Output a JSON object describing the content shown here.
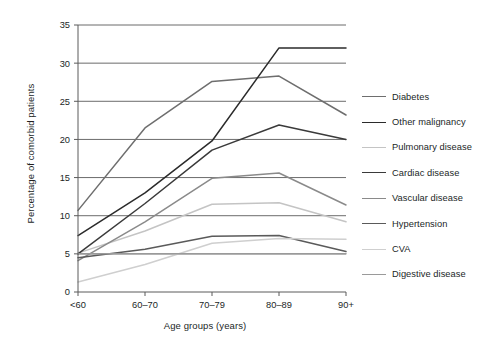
{
  "chart_data": {
    "type": "line",
    "title": "",
    "xlabel": "Age groups (years)",
    "ylabel": "Percentage of comorbid patients",
    "categories": [
      "<60",
      "60–70",
      "70–79",
      "80–89",
      "90+"
    ],
    "ylim": [
      0,
      35
    ],
    "yticks": [
      0,
      5,
      10,
      15,
      20,
      25,
      30,
      35
    ],
    "ytick_labels": [
      "0",
      "5",
      "10",
      "15",
      "20",
      "25",
      "30",
      "35"
    ],
    "grid": "horizontal",
    "legend_position": "right",
    "series": [
      {
        "name": "Diabetes",
        "color": "#6e6e6e",
        "values": [
          10.7,
          21.5,
          27.6,
          28.3,
          23.2
        ]
      },
      {
        "name": "Other malignancy",
        "color": "#2b2b2b",
        "values": [
          7.4,
          13.0,
          19.8,
          32.0,
          32.0
        ]
      },
      {
        "name": "Pulmonary disease",
        "color": "#c4c4c4",
        "values": [
          5.1,
          8.0,
          11.5,
          11.7,
          9.2
        ]
      },
      {
        "name": "Cardiac disease",
        "color": "#3a3a3a",
        "values": [
          5.0,
          11.6,
          18.6,
          21.9,
          20.0
        ]
      },
      {
        "name": "Vascular disease",
        "color": "#8a8a8a",
        "values": [
          4.1,
          9.2,
          14.9,
          15.6,
          11.4
        ]
      },
      {
        "name": "Hypertension",
        "color": "#5a5a5a",
        "values": [
          4.5,
          5.6,
          7.3,
          7.4,
          5.3
        ]
      },
      {
        "name": "CVA",
        "color": "#cfcfcf",
        "values": [
          1.3,
          3.6,
          6.4,
          7.0,
          6.9
        ]
      },
      {
        "name": "Digestive disease",
        "color": "#9a9a9a",
        "values": [
          5.0,
          5.0,
          5.0,
          5.0,
          5.0
        ]
      }
    ]
  },
  "axes": {
    "x_title": "Age groups (years)",
    "y_title": "Percentage of comorbid patients"
  },
  "legend": {
    "entries": [
      {
        "label": "Diabetes",
        "color": "#6e6e6e"
      },
      {
        "label": "Other malignancy",
        "color": "#2b2b2b"
      },
      {
        "label": "Pulmonary disease",
        "color": "#c4c4c4"
      },
      {
        "label": "Cardiac disease",
        "color": "#3a3a3a"
      },
      {
        "label": "Vascular disease",
        "color": "#8a8a8a"
      },
      {
        "label": "Hypertension",
        "color": "#5a5a5a"
      },
      {
        "label": "CVA",
        "color": "#cfcfcf"
      },
      {
        "label": "Digestive disease",
        "color": "#9a9a9a"
      }
    ]
  },
  "style": {
    "axis_color": "#5a5a5a",
    "grid_color": "#6b6b6b",
    "text_color": "#221f1f",
    "background": "#ffffff"
  }
}
